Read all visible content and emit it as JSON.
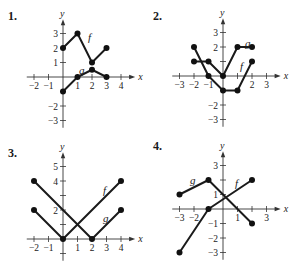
{
  "chart_data": [
    {
      "type": "line",
      "label": "1.",
      "x_ticks": [
        -2,
        -1,
        1,
        2,
        3,
        4
      ],
      "y_ticks": [
        -3,
        -2,
        1,
        2,
        3
      ],
      "xlabel": "x",
      "ylabel": "y",
      "xlim": [
        -2.5,
        4.7
      ],
      "ylim": [
        -3.5,
        3.7
      ],
      "series": [
        {
          "name": "f",
          "points": [
            [
              0,
              2
            ],
            [
              1,
              3
            ],
            [
              2,
              1
            ],
            [
              3,
              2
            ]
          ]
        },
        {
          "name": "g",
          "points": [
            [
              0,
              -1
            ],
            [
              1,
              0
            ],
            [
              2,
              0.5
            ],
            [
              3,
              0
            ]
          ]
        }
      ]
    },
    {
      "type": "line",
      "label": "2.",
      "x_ticks": [
        -3,
        -2,
        -1,
        2,
        3
      ],
      "y_ticks": [
        -3,
        -2,
        2,
        3
      ],
      "xlabel": "x",
      "ylabel": "y",
      "xlim": [
        -3.5,
        3.7
      ],
      "ylim": [
        -3.5,
        3.7
      ],
      "series": [
        {
          "name": "f",
          "points": [
            [
              -2,
              2
            ],
            [
              -1,
              0
            ],
            [
              0,
              -1
            ],
            [
              1,
              -1
            ],
            [
              2,
              1
            ]
          ]
        },
        {
          "name": "g",
          "points": [
            [
              -2,
              1
            ],
            [
              -1,
              1
            ],
            [
              0,
              0
            ],
            [
              1,
              2
            ],
            [
              2,
              2
            ]
          ]
        }
      ]
    },
    {
      "type": "line",
      "label": "3.",
      "x_ticks": [
        -2,
        -1,
        1,
        2,
        3,
        4
      ],
      "y_ticks": [
        2,
        4,
        5
      ],
      "xlabel": "x",
      "ylabel": "y",
      "xlim": [
        -2.5,
        4.7
      ],
      "ylim": [
        -1.5,
        5.7
      ],
      "series": [
        {
          "name": "f",
          "points": [
            [
              -2,
              2
            ],
            [
              0,
              0
            ],
            [
              4,
              4
            ]
          ]
        },
        {
          "name": "g",
          "points": [
            [
              -2,
              4
            ],
            [
              2,
              0
            ],
            [
              4,
              2
            ]
          ]
        }
      ]
    },
    {
      "type": "line",
      "label": "4.",
      "x_ticks": [
        -3,
        -2,
        1,
        3
      ],
      "y_ticks": [
        -3,
        -2,
        -1,
        1,
        3
      ],
      "xlabel": "x",
      "ylabel": "y",
      "xlim": [
        -3.5,
        3.7
      ],
      "ylim": [
        -3.5,
        3.7
      ],
      "series": [
        {
          "name": "f",
          "points": [
            [
              -3,
              -3
            ],
            [
              -1,
              0
            ],
            [
              2,
              2
            ]
          ]
        },
        {
          "name": "g",
          "points": [
            [
              -3,
              1
            ],
            [
              -1,
              2
            ],
            [
              2,
              -1
            ]
          ]
        }
      ]
    }
  ],
  "layout": [
    {
      "ox": 63,
      "oy": 77,
      "unit": 14.5,
      "num_x": 8,
      "num_y": 20,
      "f_label": [
        88,
        41
      ],
      "g_label": [
        79,
        74
      ],
      "label_text": {
        "f": "f",
        "g": "g"
      }
    },
    {
      "ox": 223,
      "oy": 76,
      "unit": 14.5,
      "num_x": 153,
      "num_y": 20,
      "f_label": [
        240,
        70
      ],
      "g_label": [
        245,
        47
      ],
      "label_text": {
        "f": "f",
        "g": "g"
      }
    },
    {
      "ox": 63,
      "oy": 239,
      "unit": 14.5,
      "num_x": 8,
      "num_y": 157,
      "f_label": [
        103,
        194
      ],
      "g_label": [
        103,
        222
      ],
      "label_text": {
        "f": "f",
        "g": "g"
      }
    },
    {
      "ox": 223,
      "oy": 209,
      "unit": 14.5,
      "num_x": 153,
      "num_y": 150,
      "f_label": [
        235,
        187
      ],
      "g_label": [
        190,
        184
      ],
      "label_text": {
        "f": "f",
        "g": "g"
      }
    }
  ]
}
